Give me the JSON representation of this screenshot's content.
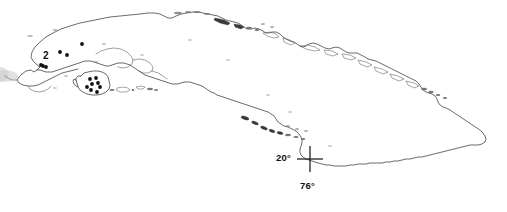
{
  "figure": {
    "kind": "distribution-map",
    "background_color": "#ffffff",
    "outline_color": "#2b2b2b",
    "dot_color": "#111111",
    "width": 507,
    "height": 212
  },
  "labels": {
    "region_number": "2",
    "latitude": "20°",
    "longitude": "76°"
  },
  "graticule": {
    "center_x": 310,
    "center_y": 159,
    "arm_length": 13,
    "latitude_value": "20°",
    "longitude_value": "76°"
  },
  "map_data": {
    "type": "point-distribution",
    "title": "",
    "island_outline_name": "Cuba",
    "secondary_island_name": "Isla de la Juventud",
    "locality_count": 14,
    "localities_mainland": [
      {
        "x": 82,
        "y": 44
      },
      {
        "x": 60,
        "y": 52
      },
      {
        "x": 67,
        "y": 55
      },
      {
        "x": 43,
        "y": 66
      },
      {
        "x": 46,
        "y": 67
      },
      {
        "x": 41,
        "y": 65
      }
    ],
    "localities_island": [
      {
        "x": 90,
        "y": 79
      },
      {
        "x": 96,
        "y": 78
      },
      {
        "x": 92,
        "y": 84
      },
      {
        "x": 98,
        "y": 83
      },
      {
        "x": 100,
        "y": 87
      },
      {
        "x": 91,
        "y": 90
      },
      {
        "x": 97,
        "y": 92
      },
      {
        "x": 87,
        "y": 87
      }
    ]
  }
}
